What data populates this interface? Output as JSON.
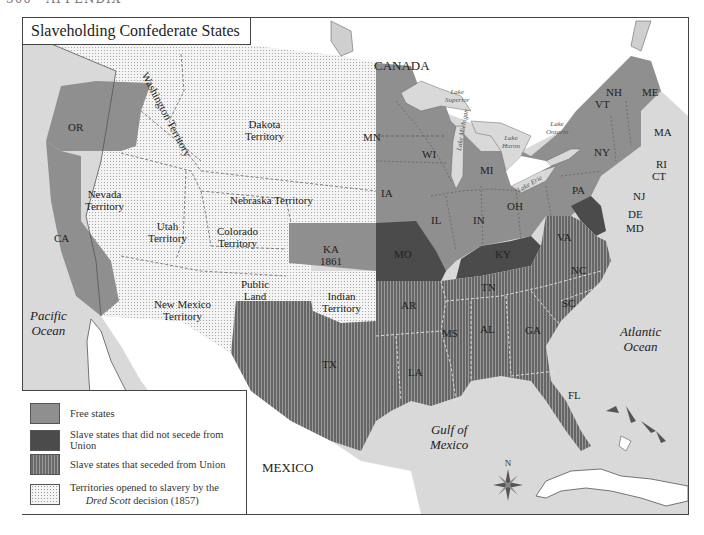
{
  "page_header": "300 · APPENDIX",
  "title": "Slaveholding Confederate States",
  "legend": [
    {
      "key": "free",
      "label": "Free states",
      "color": "#8f8f8f"
    },
    {
      "key": "no_secede",
      "label": "Slave states that did not secede from Union",
      "color": "#4b4b4b"
    },
    {
      "key": "seceded",
      "label": "Slave states that seceded from Union",
      "pattern": "vertical-stripes"
    },
    {
      "key": "territory",
      "label_line1": "Territories opened to slavery by the",
      "label_italic": "Dred Scott",
      "label_line2_rest": " decision (1857)",
      "pattern": "dots"
    }
  ],
  "regions": {
    "countries": {
      "canada": "CANADA",
      "mexico": "MEXICO"
    },
    "oceans": {
      "pacific_1": "Pacific",
      "pacific_2": "Ocean",
      "atlantic_1": "Atlantic",
      "atlantic_2": "Ocean",
      "gulf_1": "Gulf of",
      "gulf_2": "Mexico"
    },
    "lakes": {
      "superior_1": "Lake",
      "superior_2": "Superior",
      "michigan": "Lake Michigan",
      "huron_1": "Lake",
      "huron_2": "Huron",
      "erie": "Lake Erie",
      "ontario_1": "Lake",
      "ontario_2": "Ontario"
    },
    "territories": {
      "washington": "Washington Territory",
      "dakota_1": "Dakota",
      "dakota_2": "Territory",
      "nebraska": "Nebraska Territory",
      "nevada_1": "Nevada",
      "nevada_2": "Territory",
      "utah_1": "Utah",
      "utah_2": "Territory",
      "colorado_1": "Colorado",
      "colorado_2": "Territory",
      "new_mexico_1": "New Mexico",
      "new_mexico_2": "Territory",
      "public_land_1": "Public",
      "public_land_2": "Land",
      "indian_1": "Indian",
      "indian_2": "Territory"
    },
    "free_states": [
      "OR",
      "CA",
      "MN",
      "WI",
      "MI",
      "IA",
      "IL",
      "IN",
      "OH",
      "PA",
      "NY",
      "NJ",
      "VT",
      "NH",
      "ME",
      "MA",
      "RI",
      "CT"
    ],
    "kansas": {
      "abbr": "KA",
      "year": "1861"
    },
    "slave_not_seceded": [
      "MO",
      "KY",
      "MD",
      "DE"
    ],
    "slave_seceded": [
      "VA",
      "NC",
      "SC",
      "GA",
      "FL",
      "AL",
      "MS",
      "LA",
      "TX",
      "AR",
      "TN"
    ]
  },
  "compass": {
    "north_label": "N"
  },
  "colors": {
    "free": "#8f8f8f",
    "no_secede": "#4b4b4b",
    "seceded_dark": "#6a6a6a",
    "territory": "#f4f4f4",
    "water": "#d9d9d9",
    "foreign_land": "#ffffff"
  }
}
